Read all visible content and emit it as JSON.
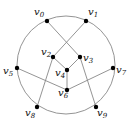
{
  "diagram": {
    "type": "graph",
    "circle": {
      "cx": 66,
      "cy": 65,
      "r": 49,
      "color": "#888888"
    },
    "vertices": [
      {
        "id": "v0",
        "label": "v",
        "sub": "0",
        "x": 47,
        "y": 21,
        "lx": 34,
        "ly": 15
      },
      {
        "id": "v1",
        "label": "v",
        "sub": "1",
        "x": 86,
        "y": 21,
        "lx": 88,
        "ly": 15
      },
      {
        "id": "v2",
        "label": "v",
        "sub": "2",
        "x": 53,
        "y": 57,
        "lx": 41,
        "ly": 55
      },
      {
        "id": "v3",
        "label": "v",
        "sub": "3",
        "x": 80,
        "y": 57,
        "lx": 83,
        "ly": 61
      },
      {
        "id": "v4",
        "label": "v",
        "sub": "4",
        "x": 67,
        "y": 70,
        "lx": 55,
        "ly": 76
      },
      {
        "id": "v5",
        "label": "v",
        "sub": "5",
        "x": 17,
        "y": 68,
        "lx": 3,
        "ly": 74
      },
      {
        "id": "v6",
        "label": "v",
        "sub": "6",
        "x": 67,
        "y": 90,
        "lx": 58,
        "ly": 96
      },
      {
        "id": "v7",
        "label": "v",
        "sub": "7",
        "x": 113,
        "y": 68,
        "lx": 116,
        "ly": 73
      },
      {
        "id": "v8",
        "label": "v",
        "sub": "8",
        "x": 37,
        "y": 107,
        "lx": 25,
        "ly": 116
      },
      {
        "id": "v9",
        "label": "v",
        "sub": "9",
        "x": 96,
        "y": 107,
        "lx": 97,
        "ly": 116
      }
    ],
    "edges": [
      [
        "v0",
        "v3"
      ],
      [
        "v1",
        "v2"
      ],
      [
        "v2",
        "v4"
      ],
      [
        "v3",
        "v4"
      ],
      [
        "v4",
        "v6"
      ],
      [
        "v5",
        "v6"
      ],
      [
        "v6",
        "v7"
      ],
      [
        "v2",
        "v8"
      ],
      [
        "v3",
        "v9"
      ]
    ],
    "edge_color": "#888888",
    "node_color": "#000000"
  }
}
